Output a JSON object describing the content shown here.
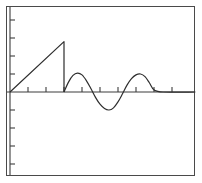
{
  "app": {
    "title": "Function Plot",
    "background_color": "#ffffff",
    "frame_color": "#4a4a4a",
    "trace_color": "#2e2e2e",
    "axis_color": "#3c3c3c"
  },
  "plot": {
    "frame": {
      "x": 6,
      "y": 6,
      "width": 189,
      "height": 170
    },
    "origin": {
      "x": 10,
      "y": 92
    },
    "tick_spacing_px": 18,
    "tick_length_px": 5,
    "x_axis_ticks_px": [
      28,
      46,
      64,
      82,
      100,
      118,
      136,
      154,
      172
    ],
    "y_axis_ticks_px": [
      20,
      38,
      56,
      74,
      110,
      128,
      146,
      164
    ]
  },
  "chart_data": {
    "type": "line",
    "title": "",
    "subtitle": "",
    "xlabel": "",
    "ylabel": "",
    "grid": false,
    "legend": null,
    "xlim": [
      0,
      10.3
    ],
    "ylim": [
      -2.8,
      4.8
    ],
    "x_tick_step": 1,
    "y_tick_step": 1,
    "series": [
      {
        "name": "ramp",
        "description": "linear ramp rising from origin then dropping vertically to zero",
        "x": [
          0.0,
          3.0,
          3.0
        ],
        "y": [
          0.0,
          2.8,
          0.0
        ]
      },
      {
        "name": "damped-sine",
        "description": "decaying sinusoid following the ramp, ending flat on the axis",
        "x": [
          3.0,
          3.25,
          3.5,
          3.75,
          4.0,
          4.25,
          4.5,
          4.75,
          5.0,
          5.25,
          5.5,
          5.75,
          6.0,
          6.25,
          6.5,
          6.75,
          7.0,
          7.25,
          7.5,
          7.75,
          8.0,
          8.5,
          10.3
        ],
        "y": [
          0.0,
          0.55,
          0.92,
          1.05,
          0.95,
          0.62,
          0.18,
          -0.3,
          -0.68,
          -0.92,
          -1.0,
          -0.88,
          -0.55,
          -0.1,
          0.38,
          0.74,
          0.95,
          1.0,
          0.85,
          0.5,
          0.12,
          0.0,
          0.0
        ]
      }
    ]
  }
}
